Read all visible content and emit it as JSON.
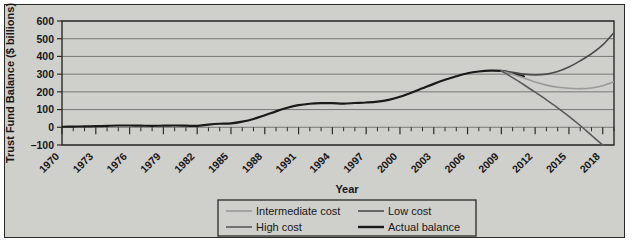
{
  "chart_data": {
    "type": "line",
    "title": "",
    "xlabel": "Year",
    "ylabel": "Trust Fund Balance ($ billions)",
    "xlim": [
      1970,
      2019
    ],
    "ylim": [
      -100,
      600
    ],
    "ytick_labels": [
      "600",
      "500",
      "400",
      "300",
      "200",
      "100",
      "0",
      "–100"
    ],
    "ytick_values": [
      600,
      500,
      400,
      300,
      200,
      100,
      0,
      -100
    ],
    "xtick_labels": [
      "1970",
      "1973",
      "1976",
      "1979",
      "1982",
      "1985",
      "1988",
      "1991",
      "1994",
      "1997",
      "2000",
      "2003",
      "2006",
      "2009",
      "2012",
      "2015",
      "2018"
    ],
    "xtick_values": [
      1970,
      1973,
      1976,
      1979,
      1982,
      1985,
      1988,
      1991,
      1994,
      1997,
      2000,
      2003,
      2006,
      2009,
      2012,
      2015,
      2018
    ],
    "minor_tick_interval": 1,
    "grid": "horizontal",
    "legend_position": "below-center",
    "series": [
      {
        "name": "Actual balance",
        "color": "#1a1a1a",
        "width": 2.2,
        "x": [
          1970,
          1971,
          1972,
          1973,
          1974,
          1975,
          1976,
          1977,
          1978,
          1979,
          1980,
          1981,
          1982,
          1983,
          1984,
          1985,
          1986,
          1987,
          1988,
          1989,
          1990,
          1991,
          1992,
          1993,
          1994,
          1995,
          1996,
          1997,
          1998,
          1999,
          2000,
          2001,
          2002,
          2003,
          2004,
          2005,
          2006,
          2007,
          2008,
          2009,
          2010,
          2011
        ],
        "values": [
          3,
          4,
          5,
          6,
          8,
          10,
          10,
          9,
          8,
          9,
          10,
          9,
          8,
          15,
          20,
          22,
          32,
          47,
          68,
          90,
          110,
          125,
          133,
          136,
          136,
          134,
          137,
          140,
          145,
          155,
          172,
          195,
          220,
          245,
          268,
          288,
          305,
          315,
          320,
          318,
          305,
          287
        ],
        "is_projection": false
      },
      {
        "name": "Low cost",
        "color": "#4c4c4c",
        "width": 1.6,
        "x": [
          2009,
          2010,
          2011,
          2012,
          2013,
          2014,
          2015,
          2016,
          2017,
          2018,
          2019
        ],
        "values": [
          318,
          310,
          300,
          296,
          300,
          315,
          340,
          375,
          415,
          465,
          535
        ],
        "is_projection": true
      },
      {
        "name": "Intermediate cost",
        "color": "#9a9a9a",
        "width": 1.6,
        "x": [
          2009,
          2010,
          2011,
          2012,
          2013,
          2014,
          2015,
          2016,
          2017,
          2018,
          2019
        ],
        "values": [
          318,
          300,
          278,
          255,
          238,
          226,
          220,
          218,
          222,
          235,
          258
        ],
        "is_projection": true
      },
      {
        "name": "High cost",
        "color": "#5a5a5a",
        "width": 1.6,
        "x": [
          2009,
          2010,
          2011,
          2012,
          2013,
          2014,
          2015,
          2016,
          2017,
          2018,
          2019
        ],
        "values": [
          318,
          280,
          240,
          198,
          155,
          110,
          62,
          10,
          -45,
          -100,
          -145
        ],
        "is_projection": true
      }
    ]
  },
  "legend": {
    "items": [
      {
        "label": "Intermediate cost",
        "color": "#9a9a9a",
        "width": 1.6
      },
      {
        "label": "Low cost",
        "color": "#4c4c4c",
        "width": 1.6
      },
      {
        "label": "High cost",
        "color": "#5a5a5a",
        "width": 1.6
      },
      {
        "label": "Actual balance",
        "color": "#1a1a1a",
        "width": 2.4
      }
    ]
  }
}
